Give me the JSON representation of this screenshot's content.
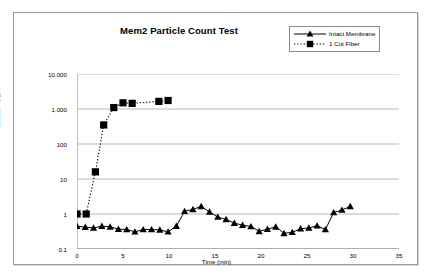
{
  "figure": {
    "title": "Mem2 Particle Count Test",
    "background_color": "#ffffff",
    "frame_color": "#9a9a9a",
    "gridline_color": "#a6a6a6",
    "axis_color": "#808080",
    "series_color": "#000000"
  },
  "legend": {
    "position": "top-right",
    "entries": [
      {
        "label": "Intact Membrane",
        "marker": "triangle-marker",
        "linestyle": "solid"
      },
      {
        "label": "1 Cut Fiber",
        "marker": "square-marker",
        "linestyle": "dotted"
      }
    ]
  },
  "axes": {
    "y_title": "Particles >2  µm",
    "x_title": "Time (min)",
    "y_ticks": [
      "10,000",
      "1,000",
      "100",
      "10",
      "1",
      "0.1"
    ],
    "x_ticks": [
      "0",
      "5",
      "10",
      "15",
      "20",
      "25",
      "30",
      "35"
    ]
  },
  "chart_data": {
    "type": "line",
    "title": "Mem2 Particle Count Test",
    "xlabel": "Time (min)",
    "ylabel": "Particles >2  µm",
    "xlim": [
      0,
      35
    ],
    "ylim": [
      0.1,
      10000
    ],
    "yscale": "log",
    "grid": true,
    "legend_position": "top-right",
    "xticks": [
      0,
      5,
      10,
      15,
      20,
      25,
      30,
      35
    ],
    "ytick_values": [
      0.1,
      1,
      10,
      100,
      1000,
      10000
    ],
    "ytick_labels": [
      "0.1",
      "1",
      "10",
      "100",
      "1,000",
      "10,000"
    ],
    "series": [
      {
        "name": "Intact Membrane",
        "marker": "triangle",
        "linestyle": "solid",
        "color": "#000000",
        "x": [
          0.0,
          0.9,
          1.8,
          2.7,
          3.6,
          4.5,
          5.4,
          6.3,
          7.2,
          8.1,
          9.0,
          9.9,
          10.8,
          11.7,
          12.6,
          13.5,
          14.4,
          15.3,
          16.2,
          17.1,
          18.0,
          18.9,
          19.8,
          20.7,
          21.6,
          22.5,
          23.4,
          24.3,
          25.2,
          26.1,
          27.0,
          27.9,
          28.8,
          29.7
        ],
        "y": [
          0.45,
          0.42,
          0.4,
          0.45,
          0.43,
          0.37,
          0.36,
          0.31,
          0.36,
          0.36,
          0.35,
          0.31,
          0.45,
          1.2,
          1.35,
          1.65,
          1.15,
          0.82,
          0.7,
          0.55,
          0.48,
          0.44,
          0.32,
          0.37,
          0.43,
          0.28,
          0.3,
          0.38,
          0.4,
          0.46,
          0.36,
          1.1,
          1.3,
          1.65
        ]
      },
      {
        "name": "1 Cut Fiber",
        "marker": "square",
        "linestyle": "dotted",
        "color": "#000000",
        "x": [
          0.0,
          1.0,
          2.0,
          2.9,
          4.0,
          5.0,
          6.0,
          8.9,
          9.9
        ],
        "y": [
          1.0,
          1.0,
          16.0,
          350.0,
          1100.0,
          1500.0,
          1450.0,
          1650.0,
          1750.0
        ]
      }
    ]
  }
}
